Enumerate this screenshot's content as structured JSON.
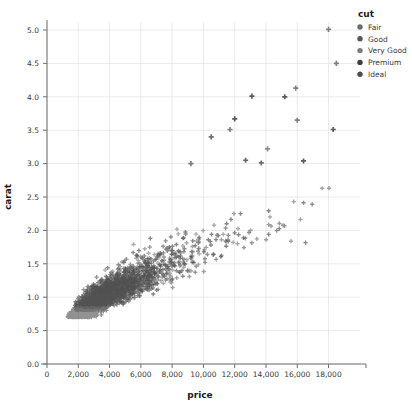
{
  "chart_data": {
    "type": "scatter",
    "title": "",
    "xlabel": "price",
    "ylabel": "carat",
    "xlim": [
      0,
      19500
    ],
    "ylim": [
      0,
      5.25
    ],
    "xticks": [
      0,
      2000,
      4000,
      6000,
      8000,
      10000,
      12000,
      14000,
      16000,
      18000
    ],
    "xticklabels": [
      "0",
      "2,000",
      "4,000",
      "6,000",
      "8,000",
      "10,000",
      "12,000",
      "14,000",
      "16,000",
      "18,000"
    ],
    "yticks": [
      0.0,
      0.5,
      1.0,
      1.5,
      2.0,
      2.5,
      3.0,
      3.5,
      4.0,
      4.5,
      5.0
    ],
    "yticklabels": [
      "0.0",
      "0.5",
      "1.0",
      "1.5",
      "2.0",
      "2.5",
      "3.0",
      "3.5",
      "4.0",
      "4.5",
      "5.0"
    ],
    "grid": true,
    "marker": "plus",
    "marker_size": 4.2,
    "legend_position": "right-top",
    "point_count": 4200,
    "series": [
      {
        "name": "Fair",
        "color": "#6b6b6b",
        "weight": 0.06,
        "carat_mean": 1.05,
        "carat_spread": 0.52,
        "price_scale": 1.08
      },
      {
        "name": "Good",
        "color": "#575757",
        "weight": 0.1,
        "carat_mean": 0.85,
        "carat_spread": 0.46,
        "price_scale": 1.02
      },
      {
        "name": "Very Good",
        "color": "#7a7a7a",
        "weight": 0.24,
        "carat_mean": 0.81,
        "carat_spread": 0.45,
        "price_scale": 1.0
      },
      {
        "name": "Premium",
        "color": "#3f3f3f",
        "weight": 0.26,
        "carat_mean": 0.89,
        "carat_spread": 0.48,
        "price_scale": 1.01
      },
      {
        "name": "Ideal",
        "color": "#4e4e4e",
        "weight": 0.34,
        "carat_mean": 0.7,
        "carat_spread": 0.42,
        "price_scale": 0.97
      }
    ],
    "outliers": [
      {
        "price": 18000,
        "carat": 5.01,
        "series": "Fair"
      },
      {
        "price": 18500,
        "carat": 4.5,
        "series": "Fair"
      },
      {
        "price": 15900,
        "carat": 4.13,
        "series": "Fair"
      },
      {
        "price": 13100,
        "carat": 4.01,
        "series": "Premium"
      },
      {
        "price": 15200,
        "carat": 4.0,
        "series": "Premium"
      },
      {
        "price": 12000,
        "carat": 3.67,
        "series": "Premium"
      },
      {
        "price": 16000,
        "carat": 3.65,
        "series": "Fair"
      },
      {
        "price": 18300,
        "carat": 3.51,
        "series": "Premium"
      },
      {
        "price": 11700,
        "carat": 3.51,
        "series": "Fair"
      },
      {
        "price": 10500,
        "carat": 3.4,
        "series": "Good"
      },
      {
        "price": 14100,
        "carat": 3.22,
        "series": "Very Good"
      },
      {
        "price": 12700,
        "carat": 3.05,
        "series": "Ideal"
      },
      {
        "price": 16400,
        "carat": 3.04,
        "series": "Premium"
      },
      {
        "price": 9200,
        "carat": 3.0,
        "series": "Fair"
      },
      {
        "price": 13700,
        "carat": 3.01,
        "series": "Good"
      }
    ]
  },
  "legend": {
    "title": "cut",
    "items": [
      {
        "label": "Fair",
        "color": "#6b6b6b"
      },
      {
        "label": "Good",
        "color": "#575757"
      },
      {
        "label": "Very Good",
        "color": "#7a7a7a"
      },
      {
        "label": "Premium",
        "color": "#3f3f3f"
      },
      {
        "label": "Ideal",
        "color": "#4e4e4e"
      }
    ]
  },
  "axes": {
    "x_title": "price",
    "y_title": "carat"
  }
}
